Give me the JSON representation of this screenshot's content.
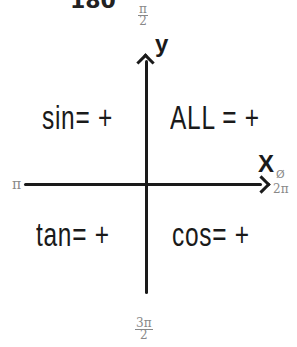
{
  "header": {
    "clipped_text_left": "180",
    "clipped_text_right": "··"
  },
  "axes": {
    "y_label": "y",
    "x_label": "X",
    "top": {
      "num": "π",
      "den": "2"
    },
    "bottom": {
      "num": "3π",
      "den": "2"
    },
    "left": "π",
    "right_top": "Ø",
    "right_bottom": "2π"
  },
  "quadrants": {
    "q1": "ALL = +",
    "q2": "sin= +",
    "q3": "tan= +",
    "q4": "cos= +"
  },
  "colors": {
    "ink": "#1a1a1a",
    "annotation": "#888888",
    "background": "#ffffff"
  }
}
